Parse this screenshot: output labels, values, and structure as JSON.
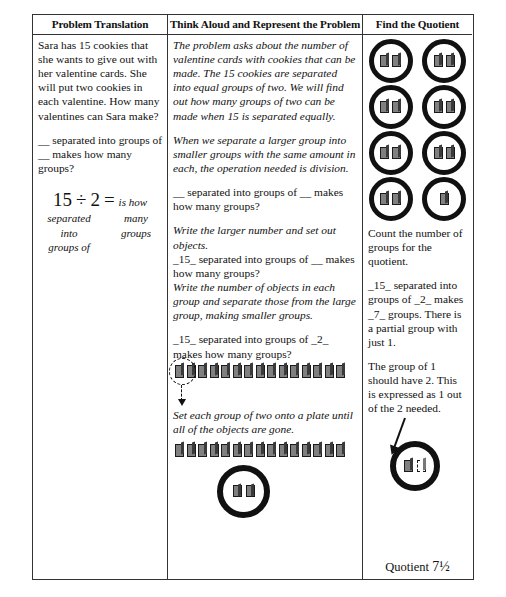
{
  "table": {
    "headers": {
      "left": "Problem Translation",
      "middle": "Think Aloud and Represent the Problem",
      "right": "Find the Quotient"
    }
  },
  "left_column": {
    "problem_text": "Sara has 15 cookies that she wants to give out with her valentine cards. She will put two cookies in each valentine. How many valentines can Sara make?",
    "sentence_frame": "__ separated into groups of __ makes how many groups?",
    "equation": {
      "dividend": "15",
      "operator": "÷",
      "divisor": "2",
      "equals": "=",
      "equals_label": "is how",
      "label_left_line1": "separated",
      "label_left_line2": "into",
      "label_left_line3": "groups of",
      "label_right_line1": "many",
      "label_right_line2": "groups"
    }
  },
  "middle_column": {
    "para1": "The problem asks about the number of valentine cards with cookies that can be made. The 15 cookies are separated into equal groups of two. We will find out how many groups of two can be made when 15 is separated equally.",
    "para2": "When we separate a larger group into smaller groups with the same amount in each, the operation needed is division.",
    "frame_blank": "__ separated into groups of __ makes how many groups?",
    "para3": "Write the larger number and set out objects.",
    "frame_filled_1": "_15_ separated into groups of __ makes how many groups?",
    "para4": "Write the number of objects in each group and separate those from the large group, making smaller groups.",
    "frame_filled_2": "_15_ separated into groups of _2_ makes how many groups?",
    "para5": "Set each group of two onto a plate until all of the objects are gone.",
    "cookie_row_1_count": 15,
    "cookie_row_2_count": 15,
    "grouped_count": 2,
    "plate_cookies": 2
  },
  "right_column": {
    "plates": [
      2,
      2,
      2,
      2,
      2,
      2,
      2,
      1
    ],
    "text1": "Count the number of groups for the quotient.",
    "text2": "_15_ separated into groups of _2_ makes _7_ groups. There is a partial group with just 1.",
    "text3": "The group of 1 should have 2. This is expressed as 1 out of the 2 needed.",
    "final_plate_cookies": 1,
    "final_plate_missing": 1,
    "quotient_label": "Quotient",
    "quotient_value": "7½"
  },
  "caption": ""
}
